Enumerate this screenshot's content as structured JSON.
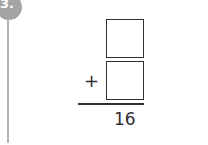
{
  "question": {
    "number": "3.",
    "operator": "+",
    "addend1": "",
    "addend2": "",
    "sum": "16"
  },
  "colors": {
    "badge": "#a4a4a4",
    "line": "#b3b3b3",
    "ink": "#2f2f2f"
  }
}
